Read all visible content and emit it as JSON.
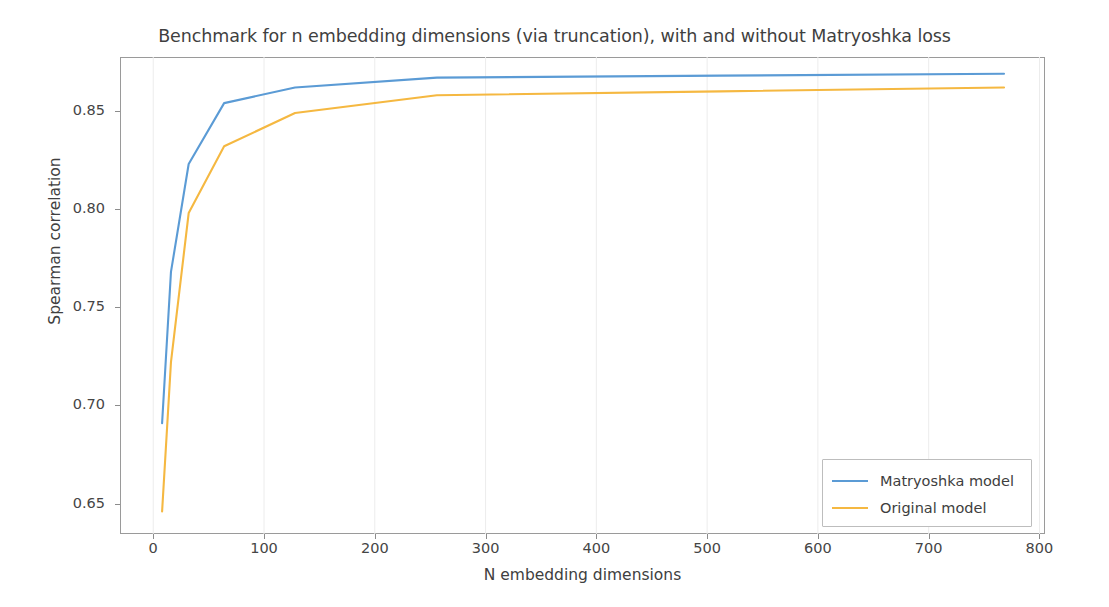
{
  "chart_data": {
    "type": "line",
    "title": "Benchmark for n embedding dimensions (via truncation), with and without Matryoshka loss",
    "xlabel": "N embedding dimensions",
    "ylabel": "Spearman correlation",
    "xlim": [
      -30,
      805
    ],
    "ylim": [
      0.6345,
      0.8775
    ],
    "xticks": [
      0,
      100,
      200,
      300,
      400,
      500,
      600,
      700,
      800
    ],
    "xtick_labels": [
      "0",
      "100",
      "200",
      "300",
      "400",
      "500",
      "600",
      "700",
      "800"
    ],
    "yticks": [
      0.65,
      0.7,
      0.75,
      0.8,
      0.85
    ],
    "ytick_labels": [
      "0.65",
      "0.70",
      "0.75",
      "0.80",
      "0.85"
    ],
    "grid": "vertical-faint",
    "legend_position": "lower-right",
    "x": [
      8,
      16,
      32,
      64,
      128,
      256,
      512,
      768
    ],
    "series": [
      {
        "name": "Matryoshka model",
        "color": "#5b9bd5",
        "values": [
          0.691,
          0.768,
          0.823,
          0.854,
          0.862,
          0.867,
          0.868,
          0.869
        ]
      },
      {
        "name": "Original model",
        "color": "#f5b841",
        "values": [
          0.646,
          0.722,
          0.798,
          0.832,
          0.849,
          0.858,
          0.86,
          0.862
        ]
      }
    ]
  },
  "legend": {
    "items": [
      {
        "label": "Matryoshka model",
        "color": "#5b9bd5"
      },
      {
        "label": "Original model",
        "color": "#f5b841"
      }
    ]
  }
}
